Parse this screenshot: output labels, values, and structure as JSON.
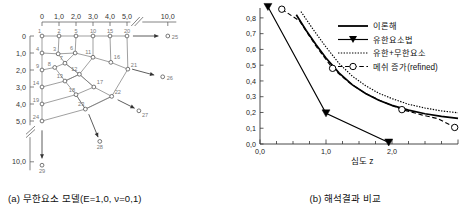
{
  "figure_a": {
    "caption": "(a) 무한요소 모델(E=1,0,  ν=0,1)",
    "caption_parts": {
      "label": "(a)",
      "title": "무한요소 모델",
      "param_E": "E=1,0",
      "param_nu": "ν=0,1"
    },
    "x_axis": {
      "label": "",
      "ticks": [
        "0",
        "1,0",
        "2,0",
        "3,0",
        "4,0",
        "5,0",
        "10,0"
      ],
      "break_after": "5,0"
    },
    "y_axis": {
      "label": "",
      "ticks": [
        "0",
        "1,0",
        "2,0",
        "3,0",
        "4,0",
        "5,0",
        "10,0"
      ],
      "break_after": "5,0"
    },
    "node_numbers_top": [
      "1",
      "2",
      "5",
      "10",
      "15",
      "20"
    ],
    "node_numbers_left": [
      "1",
      "4",
      "9",
      "14",
      "19",
      "24"
    ],
    "node_numbers_interior": [
      "3",
      "6",
      "7",
      "8",
      "11",
      "12",
      "13",
      "16",
      "17",
      "18",
      "21",
      "22",
      "23"
    ],
    "infinite_nodes": [
      "25",
      "26",
      "27",
      "28",
      "29"
    ],
    "nodes": [
      {
        "id": "1",
        "x": 0.0,
        "y": 0.0
      },
      {
        "id": "2",
        "x": 1.0,
        "y": 0.0
      },
      {
        "id": "5",
        "x": 2.0,
        "y": 0.0
      },
      {
        "id": "10",
        "x": 3.0,
        "y": 0.0
      },
      {
        "id": "15",
        "x": 4.0,
        "y": 0.0
      },
      {
        "id": "20",
        "x": 5.0,
        "y": 0.0
      },
      {
        "id": "4",
        "x": 0.0,
        "y": 1.0
      },
      {
        "id": "9",
        "x": 0.0,
        "y": 2.0
      },
      {
        "id": "14",
        "x": 0.0,
        "y": 3.0
      },
      {
        "id": "19",
        "x": 0.0,
        "y": 4.0
      },
      {
        "id": "24",
        "x": 0.0,
        "y": 5.0
      },
      {
        "id": "3",
        "x": 0.95,
        "y": 1.05
      },
      {
        "id": "6",
        "x": 1.95,
        "y": 1.0
      },
      {
        "id": "11",
        "x": 3.0,
        "y": 1.25
      },
      {
        "id": "16",
        "x": 4.05,
        "y": 1.55
      },
      {
        "id": "21",
        "x": 5.05,
        "y": 1.95
      },
      {
        "id": "7",
        "x": 1.35,
        "y": 1.6
      },
      {
        "id": "8",
        "x": 0.75,
        "y": 1.85
      },
      {
        "id": "12",
        "x": 2.2,
        "y": 2.25
      },
      {
        "id": "13",
        "x": 1.35,
        "y": 2.65
      },
      {
        "id": "17",
        "x": 3.05,
        "y": 3.0
      },
      {
        "id": "22",
        "x": 4.1,
        "y": 3.55
      },
      {
        "id": "18",
        "x": 2.0,
        "y": 3.45
      },
      {
        "id": "23",
        "x": 2.55,
        "y": 4.3
      },
      {
        "id": "25",
        "x": 7.4,
        "y": 0.0
      },
      {
        "id": "26",
        "x": 7.1,
        "y": 2.4
      },
      {
        "id": "27",
        "x": 5.7,
        "y": 4.4
      },
      {
        "id": "28",
        "x": 3.4,
        "y": 6.2
      },
      {
        "id": "29",
        "x": 0.0,
        "y": 7.6
      }
    ]
  },
  "figure_b": {
    "caption": "(b) 해석결과 비교",
    "caption_parts": {
      "label": "(b)",
      "title": "해석결과 비교"
    },
    "chart_data": {
      "type": "line",
      "title": "",
      "xlabel": "심도 z",
      "ylabel": "",
      "xlim": [
        0.0,
        3.0
      ],
      "ylim": [
        0.0,
        0.85
      ],
      "xticks": [
        "0,0",
        "1,0",
        "2,0"
      ],
      "xtick_values": [
        0.0,
        1.0,
        2.0
      ],
      "yticks": [
        "0,0",
        "0,1",
        "0,2",
        "0,3",
        "0,4",
        "0,5",
        "0,6",
        "0,7",
        "0,8"
      ],
      "ytick_values": [
        0.0,
        0.1,
        0.2,
        0.3,
        0.4,
        0.5,
        0.6,
        0.7,
        0.8
      ],
      "grid": false,
      "legend_position": "upper-right",
      "series": [
        {
          "name": "이론해",
          "style": "solid",
          "marker": "none",
          "color": "#000000",
          "x": [
            0.55,
            0.7,
            0.85,
            1.0,
            1.2,
            1.4,
            1.6,
            1.8,
            2.0,
            2.25,
            2.5,
            2.75,
            3.0
          ],
          "y": [
            0.82,
            0.72,
            0.63,
            0.545,
            0.45,
            0.375,
            0.32,
            0.278,
            0.245,
            0.215,
            0.192,
            0.175,
            0.163
          ]
        },
        {
          "name": "유한요소법",
          "style": "solid",
          "marker": "triangle-down",
          "color": "#000000",
          "x": [
            0.12,
            1.0,
            1.95
          ],
          "y": [
            0.87,
            0.195,
            0.01
          ]
        },
        {
          "name": "유한+무한요소",
          "style": "dotted",
          "marker": "none",
          "color": "#000000",
          "x": [
            0.62,
            0.8,
            1.0,
            1.2,
            1.4,
            1.6,
            1.8,
            2.0,
            2.25,
            2.5,
            2.75,
            3.0
          ],
          "y": [
            0.84,
            0.73,
            0.615,
            0.51,
            0.43,
            0.37,
            0.322,
            0.288,
            0.252,
            0.228,
            0.21,
            0.198
          ]
        },
        {
          "name": "메쉬 증가(refined)",
          "style": "dashed",
          "marker": "circle",
          "color": "#000000",
          "x": [
            0.33,
            0.6,
            0.85,
            1.1,
            1.35,
            1.6,
            1.85,
            2.15,
            2.45,
            2.7,
            2.95
          ],
          "y": [
            0.855,
            0.78,
            0.62,
            0.48,
            0.39,
            0.32,
            0.27,
            0.218,
            0.185,
            0.16,
            0.105
          ],
          "marker_points": [
            {
              "x": 0.33,
              "y": 0.855
            },
            {
              "x": 1.1,
              "y": 0.48
            },
            {
              "x": 2.15,
              "y": 0.218
            },
            {
              "x": 2.95,
              "y": 0.105
            }
          ]
        }
      ]
    },
    "legend": [
      {
        "label": "이론해",
        "style": "solid",
        "marker": "none"
      },
      {
        "label": "유한요소법",
        "style": "solid",
        "marker": "triangle-down"
      },
      {
        "label": "유한+무한요소",
        "style": "dotted",
        "marker": "none"
      },
      {
        "label": "메쉬 증가(refined)",
        "style": "dashed",
        "marker": "circle"
      }
    ]
  }
}
